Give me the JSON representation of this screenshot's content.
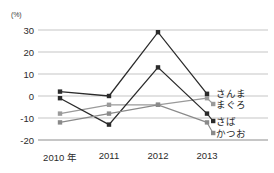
{
  "chart_data": {
    "type": "line",
    "title": "",
    "subtitle": "",
    "xlabel": "",
    "ylabel": "",
    "unit_label": "(%)",
    "categories": [
      "2010 年",
      "2011",
      "2012",
      "2013"
    ],
    "x": [
      2010,
      2011,
      2012,
      2013
    ],
    "ylim": [
      -20,
      30
    ],
    "yticks": [
      30,
      20,
      10,
      0,
      -10,
      -20
    ],
    "ytick_labels": [
      "30",
      "20",
      "10",
      "0",
      "-10",
      "-20"
    ],
    "grid": true,
    "legend_position": "right",
    "series": [
      {
        "name": "さんま",
        "values": [
          2,
          0,
          29,
          1
        ],
        "color": "#2b2b2b",
        "marker": "square"
      },
      {
        "name": "まぐろ",
        "values": [
          -8,
          -4,
          -4,
          -1
        ],
        "color": "#9a9a9a",
        "marker": "square"
      },
      {
        "name": "さば",
        "values": [
          -1,
          -13,
          13,
          -8
        ],
        "color": "#2b2b2b",
        "marker": "square"
      },
      {
        "name": "かつお",
        "values": [
          -12,
          -8,
          -4,
          -12
        ],
        "color": "#8a8a8a",
        "marker": "square"
      }
    ]
  },
  "legend": {
    "items": [
      {
        "label": "さんま"
      },
      {
        "label": "まぐろ"
      },
      {
        "label": "さば"
      },
      {
        "label": "かつお"
      }
    ]
  }
}
